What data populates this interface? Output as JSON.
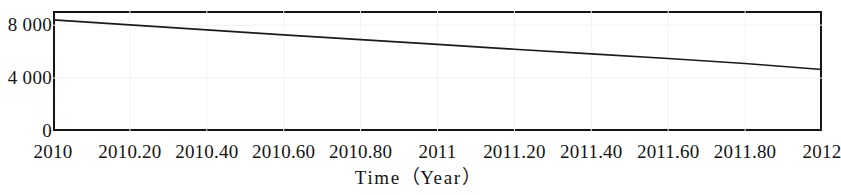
{
  "chart_data": {
    "type": "line",
    "title": "",
    "subtitle": "",
    "xlabel": "Time（Year）",
    "ylabel": "",
    "xlim": [
      2010,
      2012
    ],
    "ylim": [
      0,
      9070
    ],
    "grid": true,
    "legend": null,
    "legend_position": "none",
    "x_ticks": [
      2010,
      2010.2,
      2010.4,
      2010.6,
      2010.8,
      2011,
      2011.2,
      2011.4,
      2011.6,
      2011.8,
      2012
    ],
    "x_tick_labels": [
      "2010",
      "2010.20",
      "2010.40",
      "2010.60",
      "2010.80",
      "2011",
      "2011.20",
      "2011.40",
      "2011.60",
      "2011.80",
      "2012"
    ],
    "y_ticks": [
      0,
      4000,
      8000
    ],
    "y_tick_labels": [
      "8 000",
      "4 000",
      "0"
    ],
    "series": [
      {
        "name": "",
        "x": [
          2010,
          2010.2,
          2010.4,
          2010.6,
          2010.8,
          2011,
          2011.2,
          2011.4,
          2011.6,
          2011.8,
          2012
        ],
        "values": [
          8400,
          8020,
          7640,
          7270,
          6900,
          6540,
          6180,
          5830,
          5480,
          5100,
          4650
        ]
      }
    ]
  },
  "axes": {
    "y_labels": [
      {
        "text": "8 000",
        "value": 8000
      },
      {
        "text": "4 000",
        "value": 4000
      },
      {
        "text": "0",
        "value": 0
      }
    ],
    "x_labels": [
      {
        "text": "2010",
        "value": 2010
      },
      {
        "text": "2010.20",
        "value": 2010.2
      },
      {
        "text": "2010.40",
        "value": 2010.4
      },
      {
        "text": "2010.60",
        "value": 2010.6
      },
      {
        "text": "2010.80",
        "value": 2010.8
      },
      {
        "text": "2011",
        "value": 2011
      },
      {
        "text": "2011.20",
        "value": 2011.2
      },
      {
        "text": "2011.40",
        "value": 2011.4
      },
      {
        "text": "2011.60",
        "value": 2011.6
      },
      {
        "text": "2011.80",
        "value": 2011.8
      },
      {
        "text": "2012",
        "value": 2012
      }
    ],
    "x_title_prefix": "Time",
    "x_title_open_paren": "（",
    "x_title_inner": "Year",
    "x_title_close_paren": "）"
  },
  "colors": {
    "line": "#1b1b1b",
    "frame": "#151515",
    "grid": "#f2f2f2",
    "background": "#ffffff",
    "text": "#141414"
  }
}
